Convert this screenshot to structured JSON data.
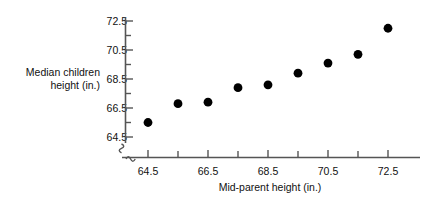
{
  "chart_data": {
    "type": "scatter",
    "title": "",
    "xlabel": "Mid-parent height (in.)",
    "ylabel": "Median children height (in.)",
    "ylabel_line1": "Median children",
    "ylabel_line2": "height (in.)",
    "x": [
      64.5,
      65.5,
      66.5,
      67.5,
      68.5,
      69.5,
      70.5,
      71.5,
      72.5
    ],
    "y": [
      65.5,
      66.8,
      66.9,
      67.9,
      68.1,
      68.9,
      69.6,
      70.2,
      72.0
    ],
    "xlim": [
      64.1,
      72.9
    ],
    "ylim": [
      64.0,
      72.9
    ],
    "xticks": [
      64.5,
      66.5,
      68.5,
      70.5,
      72.5
    ],
    "xtick_labels": [
      "64.5",
      "66.5",
      "68.5",
      "70.5",
      "72.5"
    ],
    "xminor_ticks": [
      65.5,
      67.5,
      69.5,
      71.5
    ],
    "yticks": [
      64.5,
      66.5,
      68.5,
      70.5,
      72.5
    ],
    "ytick_labels": [
      "64.5",
      "66.5",
      "68.5",
      "70.5",
      "72.5"
    ],
    "yminor_ticks": [
      65.5,
      67.5,
      69.5,
      71.5
    ],
    "grid": false,
    "legend": null,
    "marker": "filled-circle",
    "marker_color": "#000000",
    "axis_color": "#555555",
    "axis_break": true,
    "axis_break_symbol": "zigzag"
  },
  "colors": {
    "background": "#ffffff",
    "text": "#111111",
    "marker": "#000000",
    "axis": "#555555"
  }
}
